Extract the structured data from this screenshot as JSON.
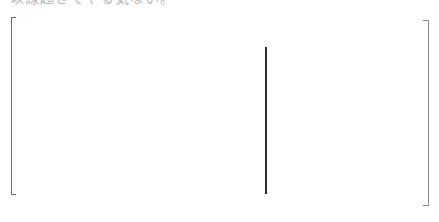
{
  "header": {
    "clipped_text": "以線起きてやる気ない。"
  },
  "colors": {
    "text": "#b8b8b8",
    "left_bracket": "#6a6a6a",
    "right_bracket": "#8a8a8a",
    "divider": "#2a2a2a",
    "background": "#ffffff"
  }
}
